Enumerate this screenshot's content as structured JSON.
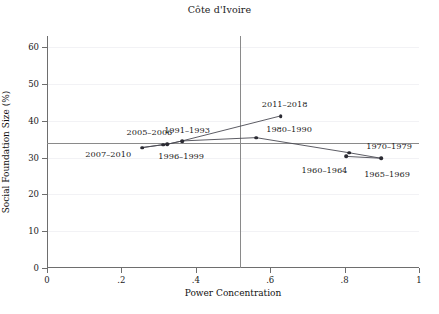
{
  "chart_data": {
    "type": "line",
    "title": "Côte d'Ivoire",
    "xlabel": "Power Concentration",
    "ylabel": "Social Foundation Size (%)",
    "xlim": [
      0,
      1
    ],
    "ylim": [
      0,
      63
    ],
    "grid": true,
    "legend": "none",
    "xticks": [
      0,
      0.2,
      0.4,
      0.6,
      0.8,
      1
    ],
    "xtick_labels": [
      "0",
      ".2",
      ".4",
      ".6",
      ".8",
      "1"
    ],
    "yticks": [
      0,
      10,
      20,
      30,
      40,
      50,
      60
    ],
    "ytick_labels": [
      "0",
      "10",
      "20",
      "30",
      "40",
      "50",
      "60"
    ],
    "reference_lines": {
      "horizontal_y": 34,
      "vertical_x": 0.52
    },
    "points": [
      {
        "label": "1960–1964",
        "x": 0.805,
        "y": 30.3,
        "label_dx": -22,
        "label_dy": 14
      },
      {
        "label": "1965–1969",
        "x": 0.898,
        "y": 29.8,
        "label_dx": 6,
        "label_dy": 16
      },
      {
        "label": "1970–1979",
        "x": 0.812,
        "y": 31.3,
        "label_dx": 40,
        "label_dy": -7
      },
      {
        "label": "1980–1990",
        "x": 0.562,
        "y": 35.4,
        "label_dx": 33,
        "label_dy": -9
      },
      {
        "label": "1991–1993",
        "x": 0.363,
        "y": 34.5,
        "label_dx": 5,
        "label_dy": -11
      },
      {
        "label": "1996–1999",
        "x": 0.323,
        "y": 33.6,
        "label_dx": 14,
        "label_dy": 12
      },
      {
        "label": "2005–2006",
        "x": 0.313,
        "y": 33.5,
        "label_dx": -14,
        "label_dy": -13
      },
      {
        "label": "2007–2010",
        "x": 0.256,
        "y": 32.7,
        "label_dx": -34,
        "label_dy": 6
      },
      {
        "label": "2011–2018",
        "x": 0.628,
        "y": 41.3,
        "label_dx": 4,
        "label_dy": -12
      }
    ],
    "path_order": [
      "1960–1964",
      "1965–1969",
      "1970–1979",
      "1980–1990",
      "1991–1993",
      "1996–1999",
      "2005–2006",
      "2007–2010"
    ],
    "secondary_path_order": [
      "2007–2010",
      "2005–2006",
      "1996–1999",
      "1991–1993",
      "2011–2018"
    ],
    "colors": {
      "marker": "#2b2b33",
      "line": "#4a4a52",
      "axis": "#6e6e6e",
      "reference_line": "#8a8a8a",
      "grid": "#f2f2f5",
      "text": "#1a1a1a",
      "background": "#ffffff"
    }
  }
}
